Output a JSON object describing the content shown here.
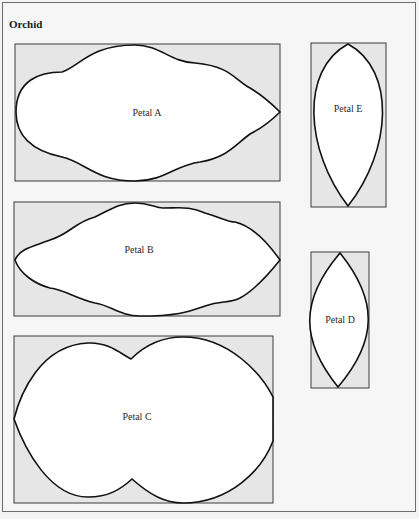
{
  "diagram": {
    "title": "Orchid",
    "colors": {
      "background": "#f6f6f6",
      "box_fill": "#e6e6e6",
      "box_stroke": "#3a3a3a",
      "petal_fill": "#ffffff",
      "petal_stroke": "#111111"
    },
    "petals": [
      {
        "id": "A",
        "label": "Petal A",
        "box": {
          "x": 15,
          "y": 44,
          "w": 265,
          "h": 137
        },
        "shape": "wavy-ellipse"
      },
      {
        "id": "B",
        "label": "Petal B",
        "box": {
          "x": 14,
          "y": 202,
          "w": 266,
          "h": 114
        },
        "shape": "wavy-ellipse"
      },
      {
        "id": "C",
        "label": "Petal C",
        "box": {
          "x": 14,
          "y": 336,
          "w": 259,
          "h": 167
        },
        "shape": "double-lobe"
      },
      {
        "id": "D",
        "label": "Petal D",
        "box": {
          "x": 311,
          "y": 252,
          "w": 58,
          "h": 136
        },
        "shape": "lens"
      },
      {
        "id": "E",
        "label": "Petal E",
        "box": {
          "x": 311,
          "y": 43,
          "w": 75,
          "h": 164
        },
        "shape": "teardrop-lens"
      }
    ]
  }
}
